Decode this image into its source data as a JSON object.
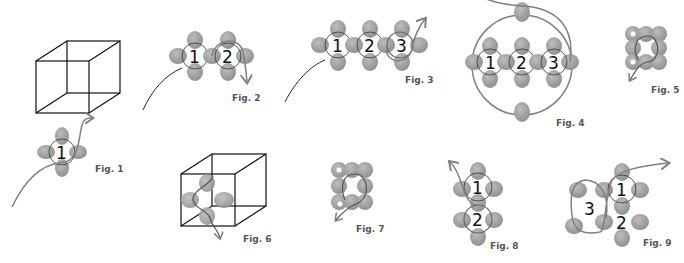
{
  "figures": [
    {
      "id": 1,
      "label": "Fig. 1",
      "numbers": [
        "1"
      ]
    },
    {
      "id": 2,
      "label": "Fig. 2",
      "numbers": [
        "1",
        "2"
      ]
    },
    {
      "id": 3,
      "label": "Fig. 3",
      "numbers": [
        "1",
        "2",
        "3"
      ]
    },
    {
      "id": 4,
      "label": "Fig. 4",
      "numbers": [
        "1",
        "2",
        "3"
      ]
    },
    {
      "id": 5,
      "label": "Fig. 5",
      "numbers": []
    },
    {
      "id": 6,
      "label": "Fig. 6",
      "numbers": []
    },
    {
      "id": 7,
      "label": "Fig. 7",
      "numbers": []
    },
    {
      "id": 8,
      "label": "Fig. 8",
      "numbers": [
        "1",
        "2"
      ]
    },
    {
      "id": 9,
      "label": "Fig. 9",
      "numbers": [
        "1",
        "2",
        "3"
      ]
    }
  ],
  "colors": {
    "bead": "#9a9a9a",
    "bead_highlight": "#b8b8b8",
    "thread": "#808080",
    "cube_edge": "#111111",
    "label": "#555555"
  }
}
